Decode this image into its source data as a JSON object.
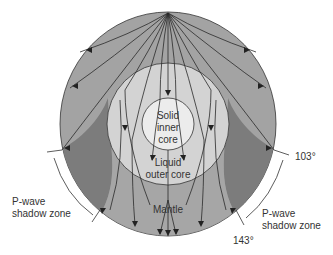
{
  "diagram": {
    "labels": {
      "inner_core": [
        "Solid",
        "inner",
        "core"
      ],
      "outer_core": [
        "Liquid",
        "outer core"
      ],
      "mantle": "Mantle",
      "shadow_left": [
        "P-wave",
        "shadow zone"
      ],
      "shadow_right": [
        "P-wave",
        "shadow zone"
      ],
      "angle_103": "103°",
      "angle_143": "143°"
    },
    "colors": {
      "mantle": "#a3a3a3",
      "mantle_inner_band": "#a9a9a9",
      "shadow": "#7c7c7c",
      "outer_core": "#d3d3d3",
      "inner_core": "#ececec",
      "line": "#2a2a2a"
    }
  }
}
